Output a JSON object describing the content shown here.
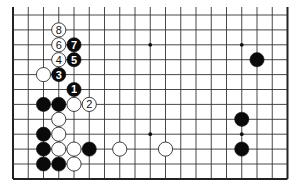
{
  "diagram": {
    "type": "go-board-partial",
    "board": {
      "columns": 19,
      "rows_visible": 12,
      "edges": [
        "left",
        "right",
        "bottom"
      ],
      "origin_x": 13,
      "origin_y": 15,
      "spacing_x": 15.25,
      "spacing_y": 14.9,
      "top_extension": 8,
      "colors": {
        "line": "#333333",
        "edge": "#222222",
        "black": "#0a0a0a",
        "white": "#ffffff"
      }
    },
    "star_points": [
      {
        "col": 3,
        "row": 2
      },
      {
        "col": 9,
        "row": 2
      },
      {
        "col": 15,
        "row": 2
      },
      {
        "col": 3,
        "row": 8
      },
      {
        "col": 9,
        "row": 8
      },
      {
        "col": 15,
        "row": 8
      }
    ],
    "stones": [
      {
        "color": "white",
        "col": 3,
        "row": 1,
        "label": "8"
      },
      {
        "color": "white",
        "col": 3,
        "row": 2,
        "label": "6"
      },
      {
        "color": "black",
        "col": 4,
        "row": 2,
        "label": "7"
      },
      {
        "color": "white",
        "col": 3,
        "row": 3,
        "label": "4"
      },
      {
        "color": "black",
        "col": 4,
        "row": 3,
        "label": "5"
      },
      {
        "color": "white",
        "col": 2,
        "row": 4,
        "label": ""
      },
      {
        "color": "black",
        "col": 3,
        "row": 4,
        "label": "3"
      },
      {
        "color": "black",
        "col": 4,
        "row": 5,
        "label": "1"
      },
      {
        "color": "black",
        "col": 2,
        "row": 6,
        "label": ""
      },
      {
        "color": "black",
        "col": 3,
        "row": 6,
        "label": ""
      },
      {
        "color": "white",
        "col": 4,
        "row": 6,
        "label": ""
      },
      {
        "color": "white",
        "col": 5,
        "row": 6,
        "label": "2"
      },
      {
        "color": "white",
        "col": 3,
        "row": 7,
        "label": ""
      },
      {
        "color": "black",
        "col": 2,
        "row": 8,
        "label": ""
      },
      {
        "color": "white",
        "col": 3,
        "row": 8,
        "label": ""
      },
      {
        "color": "black",
        "col": 2,
        "row": 9,
        "label": ""
      },
      {
        "color": "white",
        "col": 3,
        "row": 9,
        "label": ""
      },
      {
        "color": "white",
        "col": 4,
        "row": 9,
        "label": ""
      },
      {
        "color": "black",
        "col": 5,
        "row": 9,
        "label": ""
      },
      {
        "color": "white",
        "col": 7,
        "row": 9,
        "label": ""
      },
      {
        "color": "white",
        "col": 10,
        "row": 9,
        "label": ""
      },
      {
        "color": "black",
        "col": 2,
        "row": 10,
        "label": ""
      },
      {
        "color": "black",
        "col": 3,
        "row": 10,
        "label": ""
      },
      {
        "color": "white",
        "col": 4,
        "row": 10,
        "label": ""
      },
      {
        "color": "black",
        "col": 16,
        "row": 3,
        "label": ""
      },
      {
        "color": "black",
        "col": 15,
        "row": 7,
        "label": ""
      },
      {
        "color": "black",
        "col": 15,
        "row": 9,
        "label": ""
      }
    ]
  }
}
